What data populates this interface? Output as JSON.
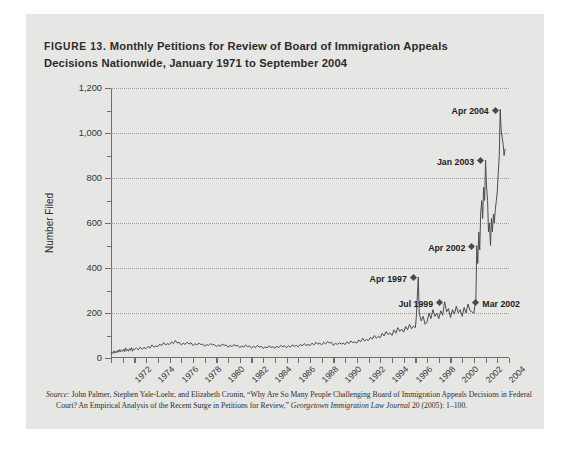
{
  "figure": {
    "number_label": "FIGURE 13.",
    "title": "Monthly Petitions for Review of Board of Immigration Appeals Decisions Nationwide, January 1971 to September 2004",
    "title_line1": "Monthly Petitions for Review of Board of Immigration Appeals",
    "title_line2": "Decisions Nationwide, January 1971 to September 2004",
    "panel_color": "#e6e6e4",
    "page_color": "#ffffff"
  },
  "source": {
    "label": "Source:",
    "text": " John Palmer, Stephen Yale-Loehr, and Elizabeth Cronin, “Why Are So Many People Challenging Board of Immigration Appeals Decisions in Federal Court? An Empirical Analysis of the Recent Surge in Petitions for Review,” ",
    "journal": "Georgetown Immigration Law Journal",
    "tail": " 20 (2005): 1–100."
  },
  "chart_data": {
    "type": "line",
    "title": "Monthly Petitions for Review of Board of Immigration Appeals Decisions Nationwide, January 1971 to September 2004",
    "xlabel": "",
    "ylabel": "Number Filed",
    "ylim": [
      0,
      1200
    ],
    "xlim": [
      1971,
      2005
    ],
    "grid": "horizontal-dotted-major",
    "legend": "none",
    "line_color": "#4d4d4d",
    "y_ticks_major": [
      0,
      200,
      400,
      600,
      800,
      1000,
      1200
    ],
    "y_tick_labels": [
      "0",
      "200",
      "400",
      "600",
      "800",
      "1,000",
      "1,200"
    ],
    "y_ticks_minor": [
      100,
      300,
      500,
      700,
      900,
      1100
    ],
    "x_tick_labels": [
      "1972",
      "1974",
      "1976",
      "1978",
      "1980",
      "1982",
      "1984",
      "1986",
      "1988",
      "1990",
      "1992",
      "1994",
      "1996",
      "1998",
      "2000",
      "2002",
      "2004"
    ],
    "x_tick_values": [
      1972,
      1974,
      1976,
      1978,
      1980,
      1982,
      1984,
      1986,
      1988,
      1990,
      1992,
      1994,
      1996,
      1998,
      2000,
      2002,
      2004
    ],
    "annotations": [
      {
        "label": "Apr 1997",
        "x": 1997.25,
        "y": 360,
        "side": "left"
      },
      {
        "label": "Jul 1999",
        "x": 1999.5,
        "y": 250,
        "side": "left"
      },
      {
        "label": "Apr 2002",
        "x": 2002.25,
        "y": 500,
        "side": "left"
      },
      {
        "label": "Mar 2002",
        "x": 2002.17,
        "y": 250,
        "side": "right"
      },
      {
        "label": "Jan 2003",
        "x": 2003.0,
        "y": 880,
        "side": "left"
      },
      {
        "label": "Apr 2004",
        "x": 2004.25,
        "y": 1105,
        "side": "left"
      }
    ],
    "x": [
      1971.0,
      1971.08,
      1971.17,
      1971.25,
      1971.33,
      1971.42,
      1971.5,
      1971.58,
      1971.67,
      1971.75,
      1971.83,
      1971.92,
      1972.0,
      1972.08,
      1972.17,
      1972.25,
      1972.33,
      1972.42,
      1972.5,
      1972.58,
      1972.67,
      1972.75,
      1972.83,
      1972.92,
      1973.0,
      1973.17,
      1973.33,
      1973.5,
      1973.67,
      1973.83,
      1974.0,
      1974.17,
      1974.33,
      1974.5,
      1974.67,
      1974.83,
      1975.0,
      1975.17,
      1975.33,
      1975.5,
      1975.67,
      1975.83,
      1976.0,
      1976.17,
      1976.33,
      1976.5,
      1976.67,
      1976.83,
      1977.0,
      1977.17,
      1977.33,
      1977.5,
      1977.67,
      1977.83,
      1978.0,
      1978.17,
      1978.33,
      1978.5,
      1978.67,
      1978.83,
      1979.0,
      1979.17,
      1979.33,
      1979.5,
      1979.67,
      1979.83,
      1980.0,
      1980.17,
      1980.33,
      1980.5,
      1980.67,
      1980.83,
      1981.0,
      1981.17,
      1981.33,
      1981.5,
      1981.67,
      1981.83,
      1982.0,
      1982.17,
      1982.33,
      1982.5,
      1982.67,
      1982.83,
      1983.0,
      1983.17,
      1983.33,
      1983.5,
      1983.67,
      1983.83,
      1984.0,
      1984.17,
      1984.33,
      1984.5,
      1984.67,
      1984.83,
      1985.0,
      1985.17,
      1985.33,
      1985.5,
      1985.67,
      1985.83,
      1986.0,
      1986.17,
      1986.33,
      1986.5,
      1986.67,
      1986.83,
      1987.0,
      1987.17,
      1987.33,
      1987.5,
      1987.67,
      1987.83,
      1988.0,
      1988.17,
      1988.33,
      1988.5,
      1988.67,
      1988.83,
      1989.0,
      1989.17,
      1989.33,
      1989.5,
      1989.67,
      1989.83,
      1990.0,
      1990.17,
      1990.33,
      1990.5,
      1990.67,
      1990.83,
      1991.0,
      1991.17,
      1991.33,
      1991.5,
      1991.67,
      1991.83,
      1992.0,
      1992.17,
      1992.33,
      1992.5,
      1992.67,
      1992.83,
      1993.0,
      1993.17,
      1993.33,
      1993.5,
      1993.67,
      1993.83,
      1994.0,
      1994.17,
      1994.33,
      1994.5,
      1994.67,
      1994.83,
      1995.0,
      1995.17,
      1995.33,
      1995.5,
      1995.67,
      1995.83,
      1996.0,
      1996.17,
      1996.33,
      1996.5,
      1996.67,
      1996.83,
      1997.0,
      1997.08,
      1997.25,
      1997.33,
      1997.5,
      1997.67,
      1997.83,
      1998.0,
      1998.17,
      1998.33,
      1998.5,
      1998.67,
      1998.83,
      1999.0,
      1999.17,
      1999.33,
      1999.5,
      1999.67,
      1999.83,
      2000.0,
      2000.17,
      2000.33,
      2000.5,
      2000.67,
      2000.83,
      2001.0,
      2001.17,
      2001.33,
      2001.5,
      2001.67,
      2001.83,
      2002.0,
      2002.08,
      2002.17,
      2002.25,
      2002.33,
      2002.42,
      2002.5,
      2002.58,
      2002.67,
      2002.75,
      2002.83,
      2002.92,
      2003.0,
      2003.08,
      2003.17,
      2003.25,
      2003.33,
      2003.42,
      2003.5,
      2003.58,
      2003.67,
      2003.75,
      2003.83,
      2003.92,
      2004.0,
      2004.08,
      2004.17,
      2004.25,
      2004.33,
      2004.42,
      2004.5,
      2004.58,
      2004.67
    ],
    "values": [
      18,
      25,
      20,
      32,
      22,
      30,
      24,
      35,
      26,
      38,
      28,
      34,
      30,
      40,
      28,
      45,
      32,
      38,
      30,
      42,
      34,
      46,
      30,
      40,
      38,
      44,
      36,
      48,
      40,
      46,
      42,
      52,
      44,
      58,
      48,
      54,
      50,
      62,
      55,
      68,
      58,
      64,
      60,
      72,
      64,
      78,
      66,
      70,
      58,
      66,
      60,
      70,
      62,
      68,
      55,
      64,
      58,
      66,
      60,
      62,
      52,
      60,
      55,
      64,
      58,
      60,
      50,
      58,
      52,
      62,
      56,
      58,
      48,
      56,
      50,
      60,
      54,
      56,
      46,
      54,
      48,
      58,
      50,
      54,
      44,
      52,
      46,
      56,
      48,
      52,
      42,
      50,
      45,
      54,
      47,
      50,
      44,
      52,
      46,
      56,
      50,
      54,
      46,
      55,
      48,
      58,
      52,
      56,
      50,
      60,
      54,
      64,
      56,
      60,
      55,
      66,
      58,
      70,
      62,
      66,
      58,
      70,
      62,
      74,
      66,
      70,
      56,
      66,
      60,
      68,
      62,
      66,
      60,
      72,
      64,
      76,
      68,
      72,
      66,
      80,
      72,
      88,
      76,
      82,
      78,
      92,
      84,
      100,
      88,
      96,
      90,
      110,
      98,
      118,
      104,
      112,
      100,
      125,
      110,
      135,
      118,
      128,
      115,
      140,
      125,
      150,
      130,
      142,
      135,
      180,
      360,
      200,
      165,
      185,
      150,
      160,
      200,
      175,
      215,
      185,
      200,
      175,
      210,
      190,
      250,
      205,
      220,
      180,
      215,
      195,
      230,
      200,
      215,
      185,
      225,
      200,
      240,
      210,
      205,
      200,
      230,
      250,
      500,
      420,
      560,
      480,
      640,
      700,
      620,
      760,
      700,
      880,
      760,
      700,
      560,
      600,
      500,
      620,
      560,
      640,
      600,
      660,
      700,
      740,
      820,
      900,
      1105,
      1010,
      980,
      950,
      900,
      930
    ]
  }
}
